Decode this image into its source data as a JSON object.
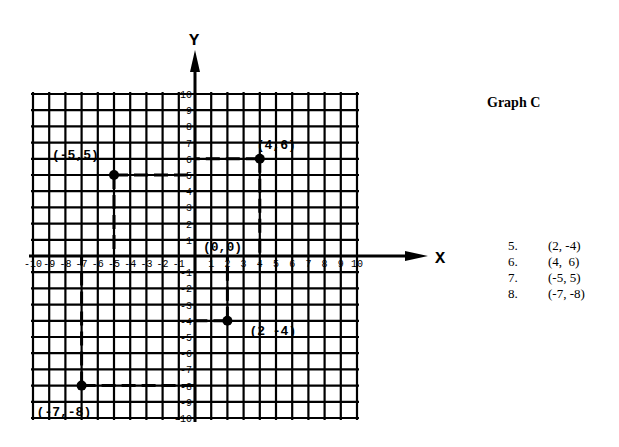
{
  "page": {
    "title": "Graph C",
    "answers": [
      {
        "num": "5.",
        "value": "(2, -4)"
      },
      {
        "num": "6.",
        "value": "(4,  6)"
      },
      {
        "num": "7.",
        "value": "(-5, 5)"
      },
      {
        "num": "8.",
        "value": "(-7, -8)"
      }
    ]
  },
  "chart_data": {
    "type": "scatter",
    "title": "Graph C",
    "xlabel": "X",
    "ylabel": "Y",
    "xlim": [
      -10,
      10
    ],
    "ylim": [
      -10,
      10
    ],
    "grid": true,
    "x_ticks": [
      -10,
      -9,
      -8,
      -7,
      -6,
      -5,
      -4,
      -3,
      -2,
      -1,
      1,
      2,
      3,
      4,
      5,
      6,
      7,
      8,
      9,
      10
    ],
    "y_ticks": [
      -10,
      -9,
      -8,
      -7,
      -6,
      -5,
      -4,
      -3,
      -2,
      -1,
      1,
      2,
      3,
      4,
      5,
      6,
      7,
      8,
      9,
      10
    ],
    "points": [
      {
        "x": 2,
        "y": -4,
        "label": "(2 -4)"
      },
      {
        "x": 4,
        "y": 6,
        "label": "(4,6)"
      },
      {
        "x": -5,
        "y": 5,
        "label": "(-5,5)"
      },
      {
        "x": -7,
        "y": -8,
        "label": "(-7,-8)"
      }
    ],
    "origin_label": "(0,0)",
    "annotations": [
      "dashed projection lines from each point to both axes"
    ]
  }
}
